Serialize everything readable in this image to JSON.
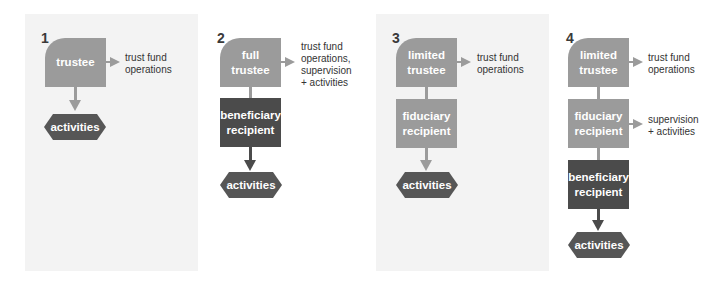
{
  "colors": {
    "light_box": "#9b9b9b",
    "dark_box": "#4b4b4b",
    "hexagon": "#565656",
    "panel_bg": "#f3f3f3"
  },
  "panels": [
    {
      "number": "1",
      "boxes": [
        {
          "text": "trustee",
          "shade": "light"
        }
      ],
      "outputs": [
        "trust fund operations"
      ],
      "end": "activities"
    },
    {
      "number": "2",
      "boxes": [
        {
          "text": "full trustee",
          "shade": "light"
        },
        {
          "text": "beneficiary recipient",
          "shade": "dark"
        }
      ],
      "outputs": [
        "trust fund operations, supervision + activities"
      ],
      "end": "activities"
    },
    {
      "number": "3",
      "boxes": [
        {
          "text": "limited trustee",
          "shade": "light"
        },
        {
          "text": "fiduciary recipient",
          "shade": "light"
        }
      ],
      "outputs": [
        "trust fund operations"
      ],
      "end": "activities"
    },
    {
      "number": "4",
      "boxes": [
        {
          "text": "limited trustee",
          "shade": "light"
        },
        {
          "text": "fiduciary recipient",
          "shade": "light"
        },
        {
          "text": "beneficiary recipient",
          "shade": "dark"
        }
      ],
      "outputs": [
        "trust fund operations",
        "supervision + activities"
      ],
      "end": "activities"
    }
  ],
  "p1": {
    "num": "1",
    "box": "trustee",
    "out": "trust fund\noperations",
    "end": "activities"
  },
  "p2": {
    "num": "2",
    "box1": "full\ntrustee",
    "box2": "beneficiary\nrecipient",
    "out": "trust fund\noperations,\nsupervision\n+ activities",
    "end": "activities"
  },
  "p3": {
    "num": "3",
    "box1": "limited\ntrustee",
    "box2": "fiduciary\nrecipient",
    "out": "trust fund\noperations",
    "end": "activities"
  },
  "p4": {
    "num": "4",
    "box1": "limited\ntrustee",
    "box2": "fiduciary\nrecipient",
    "box3": "beneficiary\nrecipient",
    "out1": "trust fund\noperations",
    "out2": "supervision\n+ activities",
    "end": "activities"
  }
}
